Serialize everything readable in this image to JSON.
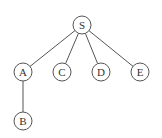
{
  "diagram": {
    "type": "tree",
    "nodes": [
      {
        "id": "S",
        "label": "S",
        "x": 82,
        "y": 25
      },
      {
        "id": "A",
        "label": "A",
        "x": 23,
        "y": 72
      },
      {
        "id": "C",
        "label": "C",
        "x": 62,
        "y": 72
      },
      {
        "id": "D",
        "label": "D",
        "x": 101,
        "y": 72
      },
      {
        "id": "E",
        "label": "E",
        "x": 140,
        "y": 72
      },
      {
        "id": "B",
        "label": "B",
        "x": 23,
        "y": 121
      }
    ],
    "edges": [
      {
        "from": "S",
        "to": "A"
      },
      {
        "from": "S",
        "to": "C"
      },
      {
        "from": "S",
        "to": "D"
      },
      {
        "from": "S",
        "to": "E"
      },
      {
        "from": "A",
        "to": "B"
      }
    ],
    "node_radius": 9,
    "colors": {
      "stroke": "#555555",
      "text": "#333333",
      "background": "#ffffff"
    }
  }
}
